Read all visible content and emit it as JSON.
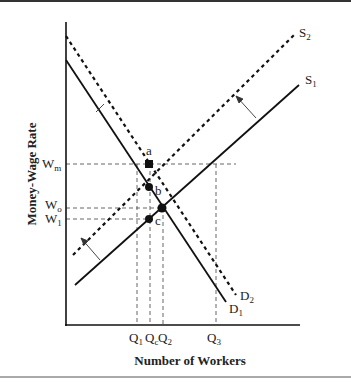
{
  "diagram": {
    "y_axis_title": "Money-Wage Rate",
    "x_axis_title": "Number of Workers",
    "y_ticks": [
      {
        "base": "W",
        "sub": "m",
        "y": 164
      },
      {
        "base": "W",
        "sub": "o",
        "y": 208
      },
      {
        "base": "W",
        "sub": "1",
        "y": 219
      }
    ],
    "x_ticks": [
      {
        "base": "Q",
        "sub": "1",
        "x": 137
      },
      {
        "base": "Q",
        "sub": "c",
        "x": 151
      },
      {
        "base": "Q",
        "sub": "2",
        "x": 163
      },
      {
        "base": "Q",
        "sub": "3",
        "x": 216
      }
    ],
    "curves": [
      {
        "name": "S",
        "sub": "2",
        "style": "dotted",
        "label": "S2"
      },
      {
        "name": "S",
        "sub": "1",
        "style": "solid",
        "label": "S1"
      },
      {
        "name": "D",
        "sub": "2",
        "style": "dotted",
        "label": "D2"
      },
      {
        "name": "D",
        "sub": "1",
        "style": "solid",
        "label": "D1"
      }
    ],
    "points": [
      {
        "label": "a",
        "shape": "square"
      },
      {
        "label": "b",
        "shape": "circle"
      },
      {
        "label": "c",
        "shape": "circle"
      },
      {
        "label": "",
        "shape": "circle",
        "note": "S1-D1 equilibrium"
      }
    ],
    "colors": {
      "ink": "#111111",
      "guide": "#555555",
      "background": "#ffffff"
    }
  }
}
